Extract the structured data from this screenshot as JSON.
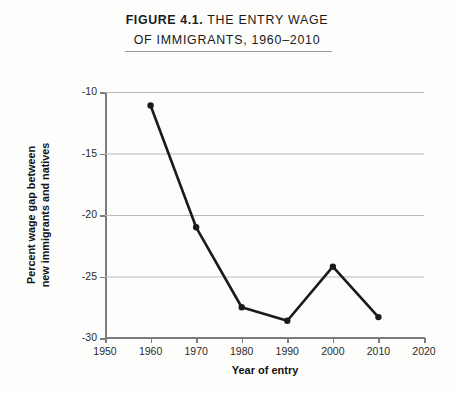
{
  "figure": {
    "title_line1_strong": "FIGURE 4.1.",
    "title_line1_rest": "THE ENTRY WAGE",
    "title_line2": "OF IMMIGRANTS, 1960–2010"
  },
  "chart_data": {
    "type": "line",
    "title": "FIGURE 4.1. THE ENTRY WAGE OF IMMIGRANTS, 1960–2010",
    "xlabel": "Year of entry",
    "ylabel": "Percent wage gap between new immigrants and natives",
    "ylabel_line1": "Percent wage gap between",
    "ylabel_line2": "new immigrants and natives",
    "x": [
      1960,
      1970,
      1980,
      1990,
      2000,
      2010
    ],
    "values": [
      -11.1,
      -21.0,
      -27.5,
      -28.6,
      -24.2,
      -28.3
    ],
    "xlim": [
      1950,
      2020
    ],
    "ylim": [
      -30,
      -10
    ],
    "xticks": [
      "1950",
      "1960",
      "1970",
      "1980",
      "1990",
      "2000",
      "2010",
      "2020"
    ],
    "xtick_values": [
      1950,
      1960,
      1970,
      1980,
      1990,
      2000,
      2010,
      2020
    ],
    "yticks": [
      "-10",
      "-15",
      "-20",
      "-25",
      "-30"
    ],
    "ytick_values": [
      -10,
      -15,
      -20,
      -25,
      -30
    ],
    "grid": "horizontal",
    "legend": "none",
    "line_color": "#1a1a1a",
    "marker": "circle",
    "marker_color": "#1a1a1a",
    "gridline_color": "#b9b9b9",
    "background_color": "#fdfdfc"
  }
}
